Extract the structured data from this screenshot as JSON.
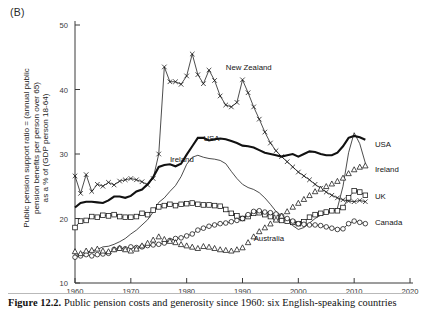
{
  "panel": {
    "label": "(B)"
  },
  "caption": {
    "figure_number": "Figure 12.2.",
    "text": "Public pension costs and generosity since 1960: six English-speaking countries"
  },
  "axis_title": "Public pension support ratio = (annual public\npension benefits per person over 65)\nas a % of (GDP person 18-64)",
  "chart_data": {
    "type": "line",
    "title": "Public pension costs and generosity since 1960: six English-speaking countries",
    "xlabel": "",
    "ylabel": "Public pension support ratio = (annual public pension benefits per person over 65) as a % of (GDP person 18-64)",
    "xlim": [
      1960,
      2020
    ],
    "ylim": [
      10,
      50
    ],
    "xticks": [
      1960,
      1970,
      1980,
      1990,
      2000,
      2010,
      2020
    ],
    "yticks": [
      10,
      20,
      30,
      40,
      50
    ],
    "grid": false,
    "legend": "inline-annotations",
    "series": [
      {
        "name": "New Zealand",
        "marker": "x",
        "stroke": "thin",
        "label_inline": {
          "text": "New Zealand",
          "x": 1987,
          "y": 43.0
        },
        "label_right": null,
        "x": [
          1960,
          1961,
          1962,
          1963,
          1964,
          1965,
          1966,
          1967,
          1968,
          1969,
          1970,
          1971,
          1972,
          1973,
          1974,
          1975,
          1976,
          1977,
          1978,
          1979,
          1980,
          1981,
          1982,
          1983,
          1984,
          1985,
          1986,
          1987,
          1988,
          1989,
          1990,
          1991,
          1992,
          1993,
          1994,
          1995,
          1996,
          1997,
          1998,
          1999,
          2000,
          2001,
          2002,
          2003,
          2004,
          2005,
          2006,
          2007,
          2008,
          2009,
          2010,
          2011,
          2012
        ],
        "y": [
          26.6,
          23.9,
          26.8,
          24.2,
          25.3,
          25.0,
          25.6,
          25.2,
          25.8,
          26.0,
          26.2,
          26.0,
          25.7,
          25.2,
          26.2,
          30.0,
          43.5,
          41.2,
          41.2,
          40.8,
          42.1,
          45.5,
          42.3,
          40.9,
          43.0,
          41.4,
          39.0,
          37.6,
          37.3,
          38.0,
          41.5,
          39.5,
          37.3,
          35.4,
          33.4,
          31.7,
          30.5,
          29.6,
          28.8,
          28.0,
          27.2,
          26.6,
          26.0,
          25.3,
          24.7,
          24.1,
          23.6,
          23.2,
          22.9,
          22.7,
          22.6,
          22.8,
          22.6
        ]
      },
      {
        "name": "USA",
        "marker": "none",
        "stroke": "thick",
        "label_inline": {
          "text": "USA",
          "x": 1983,
          "y": 32.0
        },
        "label_right": {
          "text": "USA",
          "x": 2013,
          "y": 31.6
        },
        "x": [
          1960,
          1961,
          1962,
          1963,
          1964,
          1965,
          1966,
          1967,
          1968,
          1969,
          1970,
          1971,
          1972,
          1973,
          1974,
          1975,
          1976,
          1977,
          1978,
          1979,
          1980,
          1981,
          1982,
          1983,
          1984,
          1985,
          1986,
          1987,
          1988,
          1989,
          1990,
          1991,
          1992,
          1993,
          1994,
          1995,
          1996,
          1997,
          1998,
          1999,
          2000,
          2001,
          2002,
          2003,
          2004,
          2005,
          2006,
          2007,
          2008,
          2009,
          2010,
          2011,
          2012
        ],
        "y": [
          21.7,
          22.4,
          22.6,
          22.6,
          22.5,
          22.4,
          22.8,
          23.4,
          23.4,
          23.2,
          23.5,
          24.2,
          24.5,
          25.3,
          26.4,
          28.0,
          28.3,
          28.4,
          28.1,
          28.5,
          29.9,
          31.2,
          32.5,
          32.5,
          32.1,
          32.3,
          32.4,
          32.3,
          32.0,
          31.7,
          31.3,
          31.2,
          31.0,
          30.6,
          30.2,
          30.0,
          29.8,
          29.6,
          29.8,
          30.0,
          29.6,
          30.0,
          30.4,
          30.3,
          30.0,
          29.8,
          29.8,
          30.2,
          31.2,
          32.5,
          32.8,
          32.6,
          32.2
        ]
      },
      {
        "name": "Ireland",
        "marker": "none",
        "stroke": "thin",
        "label_inline": {
          "text": "Ireland",
          "x": 1977,
          "y": 28.8
        },
        "label_right": {
          "text": "Ireland",
          "x": 2013,
          "y": 27.6
        },
        "x": [
          1960,
          1961,
          1962,
          1963,
          1964,
          1965,
          1966,
          1967,
          1968,
          1969,
          1970,
          1971,
          1972,
          1973,
          1974,
          1975,
          1976,
          1977,
          1978,
          1979,
          1980,
          1981,
          1982,
          1983,
          1984,
          1985,
          1986,
          1987,
          1988,
          1989,
          1990,
          1991,
          1992,
          1993,
          1994,
          1995,
          1996,
          1997,
          1998,
          1999,
          2000,
          2001,
          2002,
          2003,
          2004,
          2005,
          2006,
          2007,
          2008,
          2009,
          2010,
          2011,
          2012
        ],
        "y": [
          14.2,
          14.6,
          14.8,
          15.0,
          15.2,
          15.6,
          15.7,
          16.0,
          16.4,
          16.9,
          17.6,
          18.2,
          19.0,
          19.8,
          21.0,
          22.5,
          23.2,
          24.2,
          25.1,
          26.5,
          28.4,
          29.5,
          29.8,
          29.5,
          29.3,
          29.2,
          29.0,
          28.5,
          27.3,
          26.2,
          25.3,
          24.8,
          24.5,
          24.0,
          23.2,
          22.2,
          21.1,
          20.4,
          19.6,
          18.9,
          18.3,
          18.6,
          19.3,
          20.0,
          20.5,
          20.8,
          21.0,
          21.6,
          25.0,
          30.2,
          33.3,
          31.6,
          28.6
        ]
      },
      {
        "name": "UK",
        "marker": "square",
        "stroke": "thin",
        "label_inline": null,
        "label_right": {
          "text": "UK",
          "x": 2013,
          "y": 23.5
        },
        "x": [
          1960,
          1961,
          1962,
          1963,
          1964,
          1965,
          1966,
          1967,
          1968,
          1969,
          1970,
          1971,
          1972,
          1973,
          1974,
          1975,
          1976,
          1977,
          1978,
          1979,
          1980,
          1981,
          1982,
          1983,
          1984,
          1985,
          1986,
          1987,
          1988,
          1989,
          1990,
          1991,
          1992,
          1993,
          1994,
          1995,
          1996,
          1997,
          1998,
          1999,
          2000,
          2001,
          2002,
          2003,
          2004,
          2005,
          2006,
          2007,
          2008,
          2009,
          2010,
          2011,
          2012
        ],
        "y": [
          18.6,
          19.6,
          19.7,
          20.3,
          20.2,
          20.5,
          20.4,
          20.6,
          20.3,
          20.2,
          20.2,
          20.3,
          20.8,
          20.6,
          21.3,
          21.8,
          22.0,
          22.2,
          22.0,
          22.2,
          22.3,
          22.4,
          22.2,
          22.1,
          22.1,
          22.0,
          21.9,
          21.4,
          20.8,
          20.4,
          20.0,
          20.3,
          20.8,
          20.9,
          20.6,
          20.3,
          20.1,
          19.7,
          19.6,
          19.4,
          19.2,
          19.5,
          20.2,
          20.6,
          20.8,
          21.0,
          21.2,
          21.2,
          21.7,
          23.2,
          24.3,
          24.1,
          23.6
        ]
      },
      {
        "name": "Canada",
        "marker": "circle",
        "stroke": "thin",
        "label_inline": null,
        "label_right": {
          "text": "Canada",
          "x": 2013,
          "y": 19.5
        },
        "x": [
          1960,
          1961,
          1962,
          1963,
          1964,
          1965,
          1966,
          1967,
          1968,
          1969,
          1970,
          1971,
          1972,
          1973,
          1974,
          1975,
          1976,
          1977,
          1978,
          1979,
          1980,
          1981,
          1982,
          1983,
          1984,
          1985,
          1986,
          1987,
          1988,
          1989,
          1990,
          1991,
          1992,
          1993,
          1994,
          1995,
          1996,
          1997,
          1998,
          1999,
          2000,
          2001,
          2002,
          2003,
          2004,
          2005,
          2006,
          2007,
          2008,
          2009,
          2010,
          2011,
          2012
        ],
        "y": [
          14.0,
          14.2,
          14.4,
          14.2,
          14.4,
          14.5,
          14.6,
          15.2,
          15.4,
          15.3,
          15.6,
          15.5,
          15.6,
          15.8,
          15.9,
          16.0,
          16.2,
          16.6,
          16.9,
          17.0,
          17.3,
          17.6,
          18.2,
          18.5,
          18.8,
          19.0,
          19.2,
          19.3,
          19.5,
          19.7,
          20.0,
          20.6,
          21.1,
          21.2,
          21.0,
          20.9,
          20.7,
          20.4,
          20.0,
          19.6,
          19.2,
          19.1,
          19.0,
          19.0,
          18.9,
          18.7,
          18.5,
          18.3,
          18.4,
          19.2,
          19.6,
          19.4,
          19.2
        ]
      },
      {
        "name": "Australia",
        "marker": "triangle",
        "stroke": "none",
        "label_inline": {
          "text": "Australia",
          "x": 1992,
          "y": 16.5
        },
        "label_right": null,
        "x": [
          1960,
          1961,
          1962,
          1963,
          1964,
          1965,
          1966,
          1967,
          1968,
          1969,
          1970,
          1971,
          1972,
          1973,
          1974,
          1975,
          1976,
          1977,
          1978,
          1979,
          1980,
          1981,
          1982,
          1983,
          1984,
          1985,
          1986,
          1987,
          1988,
          1989,
          1990,
          1991,
          1992,
          1993,
          1994,
          1995,
          1996,
          1997,
          1998,
          1999,
          2000,
          2001,
          2002,
          2003,
          2004,
          2005,
          2006,
          2007,
          2008,
          2009,
          2010,
          2011,
          2012
        ],
        "y": [
          14.9,
          14.6,
          15.0,
          15.1,
          15.3,
          15.0,
          14.9,
          15.2,
          15.4,
          15.2,
          15.0,
          15.3,
          15.8,
          16.2,
          16.7,
          17.2,
          16.8,
          16.5,
          16.3,
          16.0,
          15.8,
          15.6,
          15.4,
          15.7,
          15.6,
          15.4,
          15.2,
          15.1,
          15.0,
          15.2,
          15.5,
          16.3,
          17.2,
          18.0,
          18.6,
          19.2,
          19.8,
          20.4,
          21.1,
          21.8,
          22.4,
          23.0,
          23.6,
          24.2,
          24.6,
          25.0,
          25.4,
          25.8,
          26.3,
          27.0,
          27.6,
          28.0,
          28.2
        ]
      }
    ]
  }
}
